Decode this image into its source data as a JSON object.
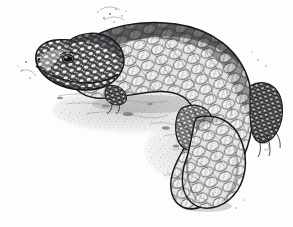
{
  "artwork": {
    "kind": "pen-and-ink-stipple-illustration",
    "subject": "shingleback-lizard",
    "subject_label": "Shingleback lizard (armoured skink) resting on ground",
    "caption": "",
    "signature": {
      "present": true,
      "legible": false,
      "text": "",
      "position": "lower-right",
      "x": 266,
      "y": 142
    },
    "canvas": {
      "width": 293,
      "height": 227
    },
    "palette": {
      "background": "#fdfdfd",
      "ink_darkest": "#17171a",
      "ink_dark": "#3c3c40",
      "ink_mid": "#6e6e73",
      "ink_light": "#9a9a9f",
      "ink_faint": "#c2c2c6",
      "scale_highlight": "#f4f4f2",
      "scale_fill": "#d6d6d4",
      "ground_wash": "#cfcfcc",
      "eye": "#101012"
    },
    "composition": {
      "pose": "body curving from head at upper-left, arching over the back to a thick blunt tail curling down at lower-right",
      "head": {
        "x": 62,
        "y": 55,
        "facing": "left",
        "snout": "blunt-rounded"
      },
      "eye": {
        "x": 68,
        "y": 59,
        "rx": 5,
        "ry": 3.4,
        "color": "#101012"
      },
      "back_arc": "high arch peaking near x=200, y=28",
      "tail": {
        "tip_x": 228,
        "tip_y": 205,
        "shape": "short-blunt-club"
      },
      "limbs": [
        {
          "name": "fore-limb",
          "x": 118,
          "y": 96,
          "visible": "partial, tucked under chest"
        },
        {
          "name": "hind-limb",
          "x": 195,
          "y": 120,
          "visible": "granular-scaled, folded"
        },
        {
          "name": "hind-foot-far",
          "x": 272,
          "y": 105,
          "visible": "toes with granular scales"
        }
      ],
      "ground": {
        "y": 100,
        "treatment": "loose stipple and soft grey wash suggesting stony soil"
      },
      "debris_flecks": "small stipple clusters above the back and around the base"
    },
    "texture": {
      "head_scales": "small bead-like tubercles, dark interstices",
      "neck_shoulder_scales": "dense small granular scales, darkest tone",
      "body_scales": "large overlapping teardrop plates in diagonal rows, pale centres with dark outlines",
      "tail_scales": "largest overlapping plates, strongly outlined"
    }
  }
}
